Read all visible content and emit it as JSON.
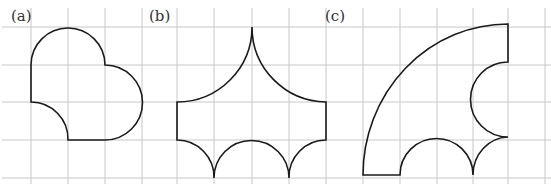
{
  "figure": {
    "panels": [
      {
        "label": "(a)",
        "description": "shape bounded by a top semicircle, right semicircle, bottom segment, concave quarter arc and left segment"
      },
      {
        "label": "(b)",
        "description": "shape with two concave arcs meeting at a top point, vertical sides, and three lower arcs"
      },
      {
        "label": "(c)",
        "description": "quarter-circle sector with semicircular and quarter-circle cutouts"
      }
    ],
    "grid": {
      "vertical_x": [
        31,
        68,
        105,
        142,
        177,
        214,
        252,
        289,
        326,
        363,
        400,
        437,
        473,
        508,
        545
      ],
      "horizontal_y": [
        27,
        65,
        102,
        140,
        178
      ],
      "color": "#c8c8c8"
    },
    "stroke_color": "#1a1a1a"
  }
}
